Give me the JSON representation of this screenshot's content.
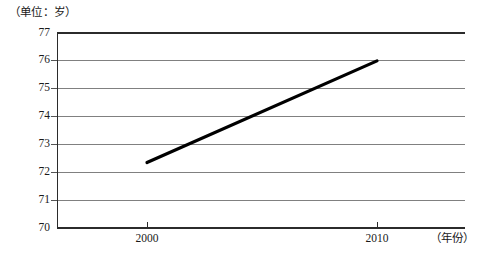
{
  "chart_data": {
    "type": "line",
    "title": "",
    "unit_caption": "（单位：岁）",
    "xlabel": "（年份）",
    "ylabel": "",
    "x": [
      2000,
      2010
    ],
    "categories": [
      "2000",
      "2010"
    ],
    "series": [
      {
        "name": "平均预期寿命",
        "values": [
          72.35,
          76.0
        ]
      }
    ],
    "xlim": [
      1995,
      2015
    ],
    "ylim": [
      70,
      77
    ],
    "yticks": [
      70,
      71,
      72,
      73,
      74,
      75,
      76,
      77
    ],
    "ytick_labels": [
      "70",
      "71",
      "72",
      "73",
      "74",
      "75",
      "76",
      "77"
    ],
    "xticks": [
      2000,
      2010
    ],
    "xtick_labels": [
      "2000",
      "2010"
    ],
    "grid": true,
    "grid_axis": "y",
    "legend": false,
    "legend_position": "none",
    "line_color": "#000000",
    "grid_color": "#808080",
    "axis_color": "#000000",
    "background_color": "#ffffff"
  },
  "axes": {
    "y_axis_name": "value-axis",
    "x_axis_name": "year-axis"
  }
}
